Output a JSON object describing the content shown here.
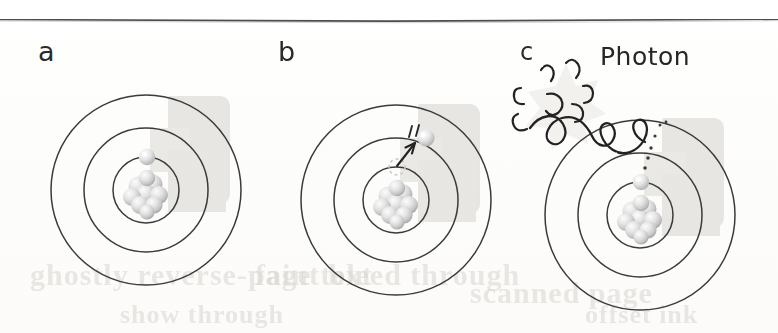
{
  "figure": {
    "panels": [
      {
        "id": "a",
        "label": "a",
        "caption": "Ground state atom: electron in innermost orbit",
        "center": {
          "x": 146,
          "y": 190
        },
        "orbit_radii": [
          33,
          62,
          95
        ],
        "electron": {
          "orbit_index": 0,
          "angle_deg": -90
        },
        "nucleus_particles": 9,
        "has_photon": false,
        "has_arrow": false
      },
      {
        "id": "b",
        "label": "b",
        "caption": "Excited state: electron jumps from inner orbit to middle orbit",
        "center": {
          "x": 396,
          "y": 200
        },
        "orbit_radii": [
          33,
          62,
          95
        ],
        "electron": {
          "orbit_index": 1,
          "angle_deg": -68
        },
        "ghost_electron": {
          "orbit_index": 0,
          "angle_deg": -90
        },
        "nucleus_particles": 9,
        "has_photon": false,
        "has_arrow": true,
        "motion_ticks": 2
      },
      {
        "id": "c",
        "label": "c",
        "caption": "Relaxation: electron falls back and emits a photon",
        "center": {
          "x": 640,
          "y": 215
        },
        "orbit_radii": [
          33,
          62,
          95
        ],
        "electron": {
          "orbit_index": 0,
          "angle_deg": -90
        },
        "nucleus_particles": 9,
        "has_photon": true,
        "has_arrow": false,
        "photon_label": "Photon",
        "dotted_trail_dots": 6
      }
    ],
    "top_rule": true,
    "ghost_watermark_lines": [
      "ghostly reverse-page text",
      "faint bleed through",
      "scanned page",
      "offset ink",
      "show through"
    ]
  },
  "colors": {
    "ink": "#2b2b2b",
    "rule": "#4a4a4a",
    "paper": "#fdfdfc",
    "nucleus_light": "#f2f2f2",
    "nucleus_mid": "#d8d8d8",
    "nucleus_shadow": "#b4b4b4",
    "watermark_gray": "#d4d2cd",
    "ghost_text": "#d9d6d0"
  }
}
